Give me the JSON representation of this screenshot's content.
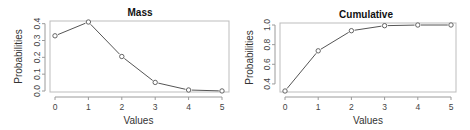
{
  "chart_data": [
    {
      "type": "line",
      "title": "Mass",
      "xlabel": "Values",
      "ylabel": "Probabilities",
      "x": [
        0,
        1,
        2,
        3,
        4,
        5
      ],
      "values": [
        0.328,
        0.41,
        0.205,
        0.051,
        0.006,
        0.0003
      ],
      "xticks": [
        "0",
        "1",
        "2",
        "3",
        "4",
        "5"
      ],
      "yticks": [
        "0.0",
        "0.1",
        "0.2",
        "0.3",
        "0.4"
      ],
      "ylim": [
        0.0,
        0.41
      ],
      "xlim": [
        0,
        5
      ],
      "markers": "open-circle",
      "grid": false,
      "legend": null
    },
    {
      "type": "line",
      "title": "Cumulative",
      "xlabel": "Values",
      "ylabel": "Probabilities",
      "x": [
        0,
        1,
        2,
        3,
        4,
        5
      ],
      "values": [
        0.328,
        0.737,
        0.942,
        0.993,
        0.9997,
        1.0
      ],
      "xticks": [
        "0",
        "1",
        "2",
        "3",
        "4",
        "5"
      ],
      "yticks": [
        "0.4",
        "0.6",
        "0.8",
        "1.0"
      ],
      "ylim": [
        0.328,
        1.0
      ],
      "xlim": [
        0,
        5
      ],
      "markers": "open-circle",
      "grid": false,
      "legend": null
    }
  ]
}
